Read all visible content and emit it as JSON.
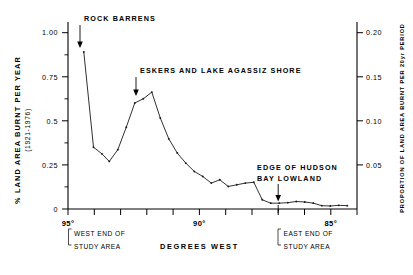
{
  "chart_data": {
    "type": "line",
    "title": "",
    "xlabel": "DEGREES WEST",
    "ylabel": "% LAND AREA BURNT PER YEAR",
    "ylabel_sub": "(1921-1976)",
    "ylabel_right": "PROPORTION OF LAND AREA BURNT PER 20yr PERIOD",
    "xlim": [
      95.5,
      83.6
    ],
    "ylim": [
      0,
      1.12
    ],
    "ylim_right": [
      0,
      0.224
    ],
    "grid": false,
    "legend": null,
    "y_ticks": [
      0,
      0.25,
      0.5,
      0.75,
      1.0
    ],
    "y_ticklabels": [
      "0",
      "0.25",
      "0.5",
      "0.75",
      "1.00"
    ],
    "y_ticks_right": [
      0.05,
      0.1,
      0.15,
      0.2
    ],
    "y_ticklabels_right": [
      "0.05",
      "0.10",
      "0.15",
      "0.20"
    ],
    "x_ticks": [
      95,
      94,
      93,
      92,
      91,
      90,
      89,
      88,
      87,
      86,
      85,
      84
    ],
    "x_ticklabels": [
      {
        "value": 95,
        "label": "95°"
      },
      {
        "value": 90,
        "label": "90°"
      },
      {
        "value": 85,
        "label": "85°"
      }
    ],
    "x_direction": "decreasing",
    "x": [
      94.85,
      94.45,
      94.1,
      93.8,
      93.45,
      93.1,
      92.75,
      92.4,
      92.05,
      91.7,
      91.35,
      91.0,
      90.65,
      90.3,
      89.95,
      89.6,
      89.25,
      88.9,
      88.55,
      88.2,
      87.85,
      87.5,
      87.15,
      86.8,
      86.45,
      86.1,
      85.75,
      85.4,
      85.05,
      84.7,
      84.35,
      84.0
    ],
    "values": [
      0.94,
      0.37,
      0.33,
      0.285,
      0.355,
      0.49,
      0.635,
      0.66,
      0.7,
      0.545,
      0.42,
      0.335,
      0.275,
      0.225,
      0.195,
      0.155,
      0.175,
      0.135,
      0.145,
      0.155,
      0.16,
      0.055,
      0.035,
      0.035,
      0.038,
      0.045,
      0.042,
      0.035,
      0.02,
      0.018,
      0.022,
      0.02
    ],
    "annotations": [
      {
        "name": "rock-barrens",
        "label": "ROCK  BARRENS",
        "x": 94.85,
        "y": 0.94
      },
      {
        "name": "eskers-lake-agassiz",
        "label": "ESKERS AND LAKE AGASSIZ SHORE",
        "x": 92.05,
        "y": 0.7
      },
      {
        "name": "edge-hudson-bay-lowland",
        "label_line1": "EDGE OF HUDSON",
        "label_line2": "BAY  LOWLAND",
        "x": 87.5,
        "y": 0.055
      }
    ],
    "x_end_markers": [
      {
        "name": "west-end-of-study-area",
        "line1": "WEST END OF",
        "line2": "STUDY AREA",
        "x": 95.0
      },
      {
        "name": "east-end-of-study-area",
        "line1": "EAST END OF",
        "line2": "STUDY AREA",
        "x": 87.5
      }
    ],
    "colors": {
      "line": "#1a1a1a",
      "axis": "#000000",
      "background": "#ffffff"
    }
  }
}
